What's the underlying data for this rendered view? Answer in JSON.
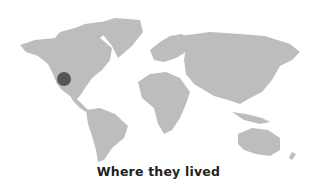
{
  "map": {
    "caption": "Where they lived",
    "land_color": "#bdbdbd",
    "marker": {
      "label": "Western United States",
      "color": "#555555",
      "cx": 64,
      "cy": 79,
      "r": 7
    }
  }
}
